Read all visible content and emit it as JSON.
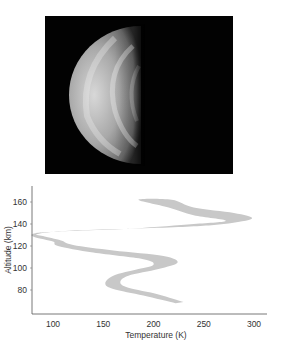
{
  "figure": {
    "photo": {
      "description": "Grayscale image of a planet shown as a half-lit crescent/gibbous disk (left half illuminated) on black background",
      "background_color": "#020202"
    }
  },
  "chart_data": {
    "type": "area",
    "title": "",
    "xlabel": "Temperature (K)",
    "ylabel": "Altitude (km)",
    "xlim": [
      79,
      313
    ],
    "ylim": [
      58,
      175
    ],
    "x_ticks": [
      100,
      150,
      200,
      250,
      300
    ],
    "y_ticks": [
      80,
      100,
      120,
      140,
      160
    ],
    "grid": false,
    "legend": null,
    "band_color": "#c8c8c8",
    "series": [
      {
        "name": "temperature band (left edge)",
        "points_T_alt": [
          [
            222,
            68
          ],
          [
            190,
            75
          ],
          [
            160,
            81
          ],
          [
            152,
            86
          ],
          [
            160,
            93
          ],
          [
            185,
            99
          ],
          [
            200,
            103
          ],
          [
            190,
            108
          ],
          [
            140,
            114
          ],
          [
            105,
            120
          ],
          [
            100,
            124
          ],
          [
            82,
            128
          ],
          [
            80,
            131
          ],
          [
            100,
            133
          ],
          [
            180,
            136
          ],
          [
            240,
            140
          ],
          [
            272,
            143
          ],
          [
            240,
            148
          ],
          [
            215,
            155
          ],
          [
            185,
            162
          ]
        ]
      },
      {
        "name": "temperature band (right edge)",
        "points_T_alt": [
          [
            230,
            69
          ],
          [
            205,
            76
          ],
          [
            175,
            82
          ],
          [
            167,
            87
          ],
          [
            175,
            93
          ],
          [
            205,
            99
          ],
          [
            224,
            105
          ],
          [
            210,
            111
          ],
          [
            160,
            116
          ],
          [
            120,
            121
          ],
          [
            108,
            125
          ],
          [
            90,
            129
          ],
          [
            85,
            131
          ],
          [
            120,
            134
          ],
          [
            220,
            137
          ],
          [
            270,
            140
          ],
          [
            298,
            145
          ],
          [
            280,
            150
          ],
          [
            240,
            155
          ],
          [
            218,
            162
          ]
        ]
      }
    ]
  }
}
